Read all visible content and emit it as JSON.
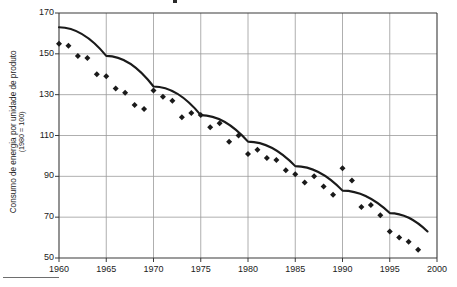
{
  "figure": {
    "ylabel_line1": "Consumo de energia por unidade de produto",
    "ylabel_line2": "(1980 = 100)",
    "footnote_rule": "footnote-separator"
  },
  "chart_data": {
    "type": "scatter",
    "title": "",
    "xlabel": "",
    "ylabel": "Consumo de energia por unidade de produto (1980 = 100)",
    "xlim": [
      1960,
      2000
    ],
    "ylim": [
      50,
      170
    ],
    "grid": true,
    "legend": "none",
    "xticks": [
      1960,
      1965,
      1970,
      1975,
      1980,
      1985,
      1990,
      1995,
      2000
    ],
    "xtick_labels": [
      "1960",
      "1965",
      "1970",
      "1975",
      "1980",
      "1985",
      "1990",
      "1995",
      "2000"
    ],
    "yticks": [
      50,
      70,
      90,
      110,
      130,
      150,
      170
    ],
    "ytick_labels": [
      "50",
      "70",
      "90",
      "110",
      "130",
      "150",
      "170"
    ],
    "marker": "diamond",
    "marker_color": "#1a1a1a",
    "trend_color": "#1a1a1a",
    "series": [
      {
        "name": "Consumo de energia por unidade de produto",
        "type": "scatter",
        "x": [
          1960,
          1961,
          1962,
          1963,
          1964,
          1965,
          1966,
          1967,
          1968,
          1969,
          1970,
          1971,
          1972,
          1973,
          1974,
          1975,
          1976,
          1977,
          1978,
          1979,
          1980,
          1981,
          1982,
          1983,
          1984,
          1985,
          1986,
          1987,
          1988,
          1989,
          1990,
          1991,
          1992,
          1993,
          1994,
          1995,
          1996,
          1997,
          1998
        ],
        "values": [
          155,
          154,
          149,
          148,
          140,
          139,
          133,
          131,
          125,
          123,
          132,
          129,
          127,
          119,
          121,
          120,
          114,
          116,
          107,
          110,
          101,
          103,
          99,
          98,
          93,
          91,
          87,
          90,
          85,
          81,
          94,
          88,
          75,
          76,
          71,
          63,
          60,
          58,
          54
        ]
      },
      {
        "name": "Linha de tendência",
        "type": "line",
        "x": [
          1960,
          1965,
          1970,
          1975,
          1980,
          1985,
          1990,
          1995,
          1999
        ],
        "values": [
          163,
          149,
          134,
          120,
          107,
          95,
          83,
          72,
          63
        ]
      }
    ]
  }
}
